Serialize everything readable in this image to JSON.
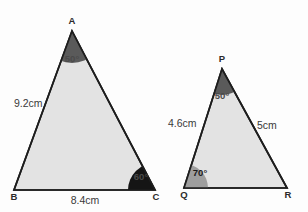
{
  "figure": {
    "background_color": "#fdfdfd",
    "triangle_fill": "#e3e3e3",
    "triangle_stroke": "#1d1d1d",
    "angle_sector_dark": "#5a5a5a",
    "angle_sector_black": "#151515",
    "angle_sector_gray": "#9e9e9e",
    "label_color": "#2b2b2b"
  },
  "triangle_abc": {
    "name": "triangle-abc",
    "vertices": {
      "a": {
        "label": "A",
        "x": 72,
        "y": 31
      },
      "b": {
        "label": "B",
        "x": 14,
        "y": 190
      },
      "c": {
        "label": "C",
        "x": 155,
        "y": 190
      }
    },
    "sides": [
      {
        "name": "side-ab",
        "label": "9.2cm",
        "x": 14,
        "y": 104
      },
      {
        "name": "side-bc",
        "label": "8.4cm",
        "x": 76,
        "y": 201
      }
    ],
    "angles": [
      {
        "name": "angle-a",
        "label": "50°",
        "x": 72,
        "y": 59,
        "sector": "dark"
      },
      {
        "name": "angle-c",
        "label": "60°",
        "x": 141,
        "y": 178,
        "sector": "black"
      }
    ]
  },
  "triangle_pqr": {
    "name": "triangle-pqr",
    "vertices": {
      "p": {
        "label": "P",
        "x": 222,
        "y": 69
      },
      "q": {
        "label": "Q",
        "x": 184,
        "y": 188
      },
      "r": {
        "label": "R",
        "x": 287,
        "y": 188
      }
    },
    "sides": [
      {
        "name": "side-pq",
        "label": "4.6cm",
        "x": 186,
        "y": 124
      },
      {
        "name": "side-pr",
        "label": "5cm",
        "x": 268,
        "y": 126
      }
    ],
    "angles": [
      {
        "name": "angle-p",
        "label": "50°",
        "x": 222,
        "y": 96,
        "sector": "dark"
      },
      {
        "name": "angle-q",
        "label": "70°",
        "x": 199,
        "y": 173,
        "sector": "gray"
      }
    ]
  }
}
